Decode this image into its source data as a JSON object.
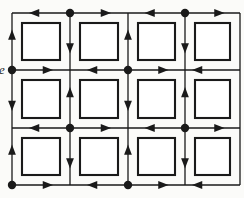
{
  "figure": {
    "kind": "directed-square-lattice",
    "caption_fragment": "e",
    "background_color": "#fbfbf9",
    "ink_color": "#1a1a1a",
    "line_width": 1.3,
    "vertex_radius": 4.2,
    "arrow_size": 5.4
  },
  "geometry": {
    "columns_x": [
      12,
      70,
      128,
      185,
      240
    ],
    "rows_y": [
      13,
      70,
      128,
      185
    ],
    "n_cols": 5,
    "n_rows": 4,
    "square_inset": 10,
    "square_size": 40
  },
  "vertices": [
    {
      "col": 0,
      "row": 0,
      "type": "plain",
      "label": ""
    },
    {
      "col": 1,
      "row": 0,
      "type": "source",
      "label": "source"
    },
    {
      "col": 2,
      "row": 0,
      "type": "sink",
      "label": "sink"
    },
    {
      "col": 3,
      "row": 0,
      "type": "source",
      "label": "source"
    },
    {
      "col": 4,
      "row": 0,
      "type": "plain",
      "label": ""
    },
    {
      "col": 0,
      "row": 1,
      "type": "source",
      "label": "source"
    },
    {
      "col": 1,
      "row": 1,
      "type": "sink",
      "label": "sink"
    },
    {
      "col": 2,
      "row": 1,
      "type": "source",
      "label": "source"
    },
    {
      "col": 3,
      "row": 1,
      "type": "sink",
      "label": "sink"
    },
    {
      "col": 4,
      "row": 1,
      "type": "plain",
      "label": ""
    },
    {
      "col": 0,
      "row": 2,
      "type": "sink",
      "label": "sink"
    },
    {
      "col": 1,
      "row": 2,
      "type": "source",
      "label": "source"
    },
    {
      "col": 2,
      "row": 2,
      "type": "sink",
      "label": "sink"
    },
    {
      "col": 3,
      "row": 2,
      "type": "source",
      "label": "source"
    },
    {
      "col": 4,
      "row": 2,
      "type": "plain",
      "label": ""
    },
    {
      "col": 0,
      "row": 3,
      "type": "source",
      "label": "source"
    },
    {
      "col": 1,
      "row": 3,
      "type": "sink",
      "label": "sink"
    },
    {
      "col": 2,
      "row": 3,
      "type": "source",
      "label": "source"
    },
    {
      "col": 3,
      "row": 3,
      "type": "sink",
      "label": "sink"
    },
    {
      "col": 4,
      "row": 3,
      "type": "plain",
      "label": ""
    }
  ],
  "squares": [
    {
      "cell_col": 0,
      "cell_row": 0
    },
    {
      "cell_col": 1,
      "cell_row": 0
    },
    {
      "cell_col": 2,
      "cell_row": 0
    },
    {
      "cell_col": 3,
      "cell_row": 0
    },
    {
      "cell_col": 0,
      "cell_row": 1
    },
    {
      "cell_col": 1,
      "cell_row": 1
    },
    {
      "cell_col": 2,
      "cell_row": 1
    },
    {
      "cell_col": 3,
      "cell_row": 1
    },
    {
      "cell_col": 0,
      "cell_row": 2
    },
    {
      "cell_col": 1,
      "cell_row": 2
    },
    {
      "cell_col": 2,
      "cell_row": 2
    },
    {
      "cell_col": 3,
      "cell_row": 2
    }
  ],
  "notes": {
    "arrow_rule": "edges are oriented away from every source vertex and into every sink vertex",
    "square_count": 12,
    "filled_dot_count": 10
  }
}
